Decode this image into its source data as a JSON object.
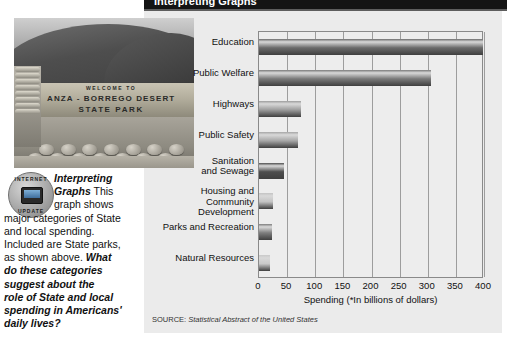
{
  "banner": {
    "title": "Interpreting Graphs"
  },
  "photo": {
    "name": "anza-borrego-state-park-sign-photo",
    "sign_line1": "WELCOME TO",
    "sign_line2": "ANZA - BORREGO DESERT",
    "sign_line3": "STATE PARK"
  },
  "badge": {
    "ring_top": "INTERNET",
    "ring_bottom": "UPDATE",
    "icon": "computer-monitor-icon"
  },
  "caption": {
    "heading": "Interpreting Graphs",
    "body": " This graph shows major categories of State and local spending. Included are State parks, as shown above. ",
    "question": "What do these categories suggest about the role of State and local spending in Americans' daily lives?",
    "line1_head": "Interpreting",
    "line2_head": "Graphs",
    "line2_rest": " This",
    "line3": "graph shows",
    "line4": "major categories of State",
    "line5": "and local spending.",
    "line6": "Included are State parks,",
    "line7_plain": "as shown above. ",
    "line7_bold": "What",
    "line8": "do these categories",
    "line9": "suggest about the",
    "line10": "role of State and local",
    "line11": "spending in Americans'",
    "line12": "daily lives?"
  },
  "source": {
    "prefix": "SOURCE: ",
    "text": "Statistical Abstract of the United States"
  },
  "chart_data": {
    "type": "bar",
    "orientation": "horizontal",
    "title": "Interpreting Graphs",
    "categories": [
      "Education",
      "Public Welfare",
      "Highways",
      "Public Safety",
      "Sanitation\nand Sewage",
      "Housing and\nCommunity Development",
      "Parks and Recreation",
      "Natural Resources"
    ],
    "values": [
      398,
      305,
      75,
      70,
      45,
      25,
      23,
      20
    ],
    "xlabel": "Spending (*In billions of dollars)",
    "ylabel": "",
    "xlim": [
      0,
      400
    ],
    "xticks": [
      0,
      50,
      100,
      150,
      200,
      250,
      300,
      350,
      400
    ],
    "ticklabels": [
      "0",
      "50",
      "100",
      "150",
      "200",
      "250",
      "300",
      "350",
      "400"
    ],
    "grid": true,
    "legend": false,
    "source": "SOURCE: Statistical Abstract of the United States",
    "bar_colors": [
      "#6b6b6b",
      "#7a7a7a",
      "#9d9d9d",
      "#a6a6a6",
      "#4e4e4e",
      "#c3c3c3",
      "#7e7e7e",
      "#c9c9c9"
    ]
  }
}
